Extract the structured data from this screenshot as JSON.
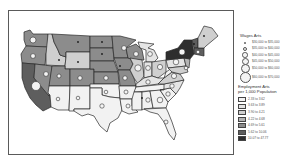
{
  "map": {
    "title": "",
    "region": "Contiguous United States",
    "colors": {
      "class1": "#f2f2f2",
      "class2": "#e4e4e4",
      "class3": "#cfcfcf",
      "class4": "#b4b4b4",
      "class5": "#8c8c8c",
      "class6": "#5e5e5e",
      "class7": "#2e2e2e",
      "border": "#2a2a2a",
      "circle_fill": "#f4f4f4"
    }
  },
  "legend": {
    "wages_title": "Wages Arts",
    "wages_classes": [
      {
        "label": "$30,000 to $35,000",
        "size": 2
      },
      {
        "label": "$35,000 to $40,000",
        "size": 4
      },
      {
        "label": "$40,000 to $45,000",
        "size": 5.5
      },
      {
        "label": "$45,000 to $50,000",
        "size": 7
      },
      {
        "label": "$50,000 to $60,000",
        "size": 9
      },
      {
        "label": "$60,000 to $70,000",
        "size": 11
      }
    ],
    "employment_title_line1": "Employment Arts",
    "employment_title_line2": "per 1,000 Population",
    "employment_classes": [
      {
        "label": "2.33 to 3.62",
        "color": "#f2f2f2"
      },
      {
        "label": "3.63 to 3.89",
        "color": "#e4e4e4"
      },
      {
        "label": "3.90 to 4.21",
        "color": "#cfcfcf"
      },
      {
        "label": "4.22 to 4.68",
        "color": "#b4b4b4"
      },
      {
        "label": "4.69 to 5.61",
        "color": "#8c8c8c"
      },
      {
        "label": "5.62 to 10.06",
        "color": "#5e5e5e"
      },
      {
        "label": "10.07 to 47.77",
        "color": "#2e2e2e"
      }
    ]
  }
}
